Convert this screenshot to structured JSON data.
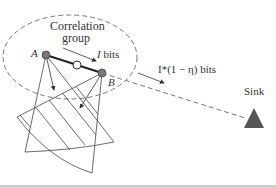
{
  "diagram": {
    "group_label_line1": "Correlation",
    "group_label_line2": "group",
    "node_a": "A",
    "node_b": "B",
    "intra_bits_var": "I",
    "intra_bits_suffix": " bits",
    "sink_bits": "I*(1 − η) bits",
    "sink_label": "Sink",
    "colors": {
      "node": "#777777",
      "sink": "#555555",
      "line": "#333333",
      "dash": "#777777"
    }
  }
}
